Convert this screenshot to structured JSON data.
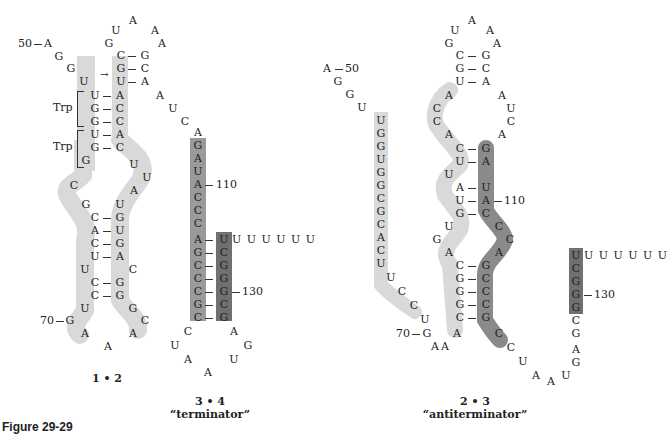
{
  "figure_label": "Figure 29-29",
  "structures": [
    {
      "id": "1-2",
      "caption": "1 • 2",
      "subcaption": "",
      "position_labels": [
        "50",
        "70"
      ],
      "annotations": [
        "Trp",
        "Trp"
      ],
      "hairpin_loop": [
        "U",
        "A",
        "A",
        "A"
      ],
      "stem_top_pairs": [
        [
          "G",
          "C"
        ],
        [
          "C",
          "G"
        ],
        [
          "G",
          "C"
        ],
        [
          "U",
          "A"
        ]
      ],
      "trp_stem_pairs": [
        [
          "U",
          "A"
        ],
        [
          "G",
          "C"
        ],
        [
          "G",
          "C"
        ],
        [
          "U",
          "A"
        ],
        [
          "G",
          "C"
        ]
      ],
      "lower_stem_pairs": [
        [
          "C",
          "G"
        ],
        [
          "A",
          "U"
        ],
        [
          "C",
          "G"
        ],
        [
          "U",
          "A"
        ],
        [
          "C",
          "G"
        ],
        [
          "C",
          "G"
        ]
      ],
      "five_prime_tail": [
        "A",
        "G",
        "G",
        "U"
      ],
      "loop_bulge_left": [
        "G",
        "C",
        "G"
      ],
      "loop_bulge_right": [
        "U",
        "U",
        "A",
        "U"
      ],
      "bottom_loop": [
        "U",
        "G",
        "A",
        "A",
        "A",
        "C",
        "G",
        "C",
        "U"
      ],
      "connector": [
        "A",
        "U",
        "C"
      ]
    },
    {
      "id": "3-4",
      "caption": "3 • 4",
      "subcaption": "“terminator”",
      "position_labels": [
        "110",
        "130"
      ],
      "left_strand": [
        "A",
        "G",
        "A",
        "U",
        "A",
        "C",
        "C",
        "C",
        "A",
        "G",
        "C",
        "C",
        "C",
        "G",
        "C"
      ],
      "right_strand": [
        "U",
        "C",
        "G",
        "G",
        "G",
        "C",
        "G"
      ],
      "poly_u_tail": "U U U U U U",
      "bottom_loop": [
        "C",
        "U",
        "A",
        "A",
        "U",
        "G",
        "A"
      ]
    },
    {
      "id": "2-3",
      "caption": "2 • 3",
      "subcaption": "“antiterminator”",
      "position_labels": [
        "50",
        "110",
        "70",
        "130"
      ],
      "left_strand": [
        "A",
        "G",
        "G",
        "U",
        "U",
        "G",
        "G",
        "U",
        "G",
        "G",
        "C",
        "G",
        "C",
        "A",
        "C",
        "U",
        "U",
        "C",
        "C",
        "U",
        "G",
        "A",
        "A"
      ],
      "hairpin_loop": [
        "U",
        "A",
        "A",
        "A"
      ],
      "stem_top_pairs": [
        [
          "G",
          "C"
        ],
        [
          "C",
          "G"
        ],
        [
          "G",
          "C"
        ],
        [
          "U",
          "A"
        ]
      ],
      "middle_left": [
        "A",
        "C",
        "C",
        "A",
        "C",
        "U",
        "U",
        "A",
        "U",
        "G",
        "U",
        "G",
        "A",
        "C",
        "G",
        "G",
        "G",
        "C",
        "A"
      ],
      "middle_right": [
        "A",
        "U",
        "C",
        "A",
        "G",
        "A",
        "U",
        "A",
        "C",
        "C",
        "C",
        "A",
        "G",
        "C",
        "C",
        "C",
        "G",
        "C",
        "C"
      ],
      "poly_u_tail": "U U U U U U",
      "right_strand": [
        "U",
        "C",
        "G",
        "G",
        "G",
        "C",
        "G",
        "A",
        "G"
      ],
      "bottom_loop": [
        "U",
        "A",
        "A",
        "U"
      ]
    }
  ]
}
